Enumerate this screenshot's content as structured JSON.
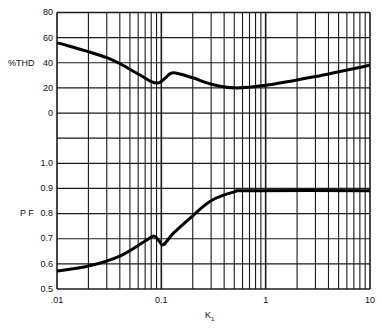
{
  "chart_data": {
    "type": "line",
    "title": "",
    "xlabel": "K1",
    "xscale": "log",
    "xlim": [
      0.01,
      10
    ],
    "x_tick_labels": [
      ".01",
      "0.1",
      "1",
      "10"
    ],
    "x_ticks": [
      0.01,
      0.1,
      1,
      10
    ],
    "grid": true,
    "panels": [
      {
        "name": "thd",
        "ylabel": "%THD",
        "ylim": [
          0,
          80
        ],
        "y_ticks": [
          0,
          20,
          40,
          60,
          80
        ],
        "y_tick_labels": [
          "0",
          "20",
          "40",
          "60",
          "80"
        ],
        "series": [
          {
            "name": "%THD",
            "x": [
              0.01,
              0.03,
              0.06,
              0.08,
              0.095,
              0.11,
              0.13,
              0.2,
              0.3,
              0.5,
              1,
              3,
              10
            ],
            "values": [
              56,
              44,
              31,
              25,
              24,
              28,
              32,
              28,
              23,
              20,
              22,
              29,
              38
            ]
          }
        ]
      },
      {
        "name": "pf",
        "ylabel": "P F",
        "ylim": [
          0.5,
          1.0
        ],
        "y_ticks": [
          0.5,
          0.6,
          0.7,
          0.8,
          0.9,
          1.0
        ],
        "y_tick_labels": [
          "0.5",
          "0.6",
          "0.7",
          "0.8",
          "0.9",
          "1.0"
        ],
        "series": [
          {
            "name": "PF",
            "x": [
              0.01,
              0.02,
              0.04,
              0.07,
              0.085,
              0.095,
              0.105,
              0.13,
              0.2,
              0.3,
              0.5,
              0.7,
              10
            ],
            "values": [
              0.57,
              0.59,
              0.63,
              0.69,
              0.71,
              0.69,
              0.675,
              0.72,
              0.79,
              0.85,
              0.885,
              0.89,
              0.89
            ]
          }
        ]
      }
    ],
    "legend": null
  },
  "labels": {
    "thd_axis": "%THD",
    "pf_axis": "P F",
    "x_axis_main": "K",
    "x_axis_sub": "1"
  }
}
